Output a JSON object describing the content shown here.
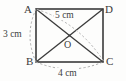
{
  "figure": {
    "kind": "geometry-diagram",
    "shape": "rectangle-with-diagonals",
    "background_color": "#fdfdfc",
    "stroke_color": "#3a3a3a",
    "dashed_color": "#a8a8a8",
    "text_color": "#3b3b3b"
  },
  "vertices": {
    "top_left": "A",
    "top_right": "D",
    "bottom_left": "B",
    "bottom_right": "C",
    "center": "O"
  },
  "dimensions": {
    "left_side": "3 cm",
    "bottom_side": "4 cm",
    "diagonal": "5 cm"
  },
  "geometry": {
    "rect": {
      "x": 36,
      "y": 9,
      "width": 67,
      "height": 53
    },
    "center_point": {
      "x": 69.5,
      "y": 35.5
    },
    "diagonals": [
      {
        "name": "A-C",
        "from": [
          36,
          9
        ],
        "to": [
          103,
          62
        ]
      },
      {
        "name": "B-D",
        "from": [
          36,
          62
        ],
        "to": [
          103,
          9
        ]
      }
    ],
    "measure_arcs": [
      {
        "name": "left-arc-A-B",
        "from": [
          36,
          9
        ],
        "to": [
          36,
          62
        ],
        "bulge": -9
      },
      {
        "name": "bottom-arc-B-C",
        "from": [
          36,
          62
        ],
        "to": [
          103,
          62
        ],
        "bulge": 10
      },
      {
        "name": "diagonal-arc-A-C",
        "from": [
          36,
          9
        ],
        "to": [
          103,
          62
        ],
        "bulge": -8
      }
    ]
  }
}
